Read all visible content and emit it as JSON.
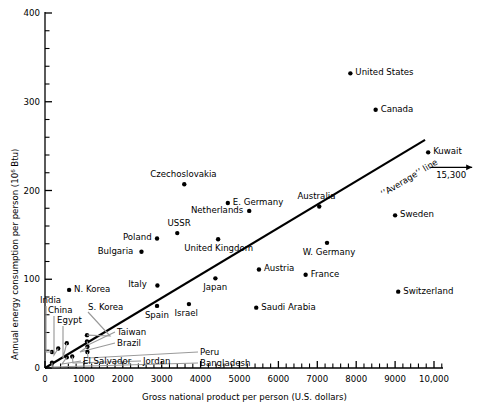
{
  "chart_data": {
    "type": "scatter",
    "title": "",
    "xlabel": "Gross national product per person (U.S. dollars)",
    "ylabel": "Annual energy consumption per person (10⁶ Btu)",
    "xlim": [
      0,
      10600
    ],
    "ylim": [
      0,
      400
    ],
    "xticks": [
      0,
      1000,
      2000,
      3000,
      4000,
      5000,
      6000,
      7000,
      8000,
      9000,
      10000
    ],
    "xtick_labels": [
      "0",
      "1000",
      "2000",
      "3000",
      "4000",
      "5000",
      "6000",
      "7000",
      "8000",
      "9000",
      "10,000"
    ],
    "yticks": [
      0,
      100,
      200,
      300,
      400
    ],
    "ytick_labels": [
      "0",
      "100",
      "200",
      "300",
      "400"
    ],
    "minor_ticks": true,
    "grid": false,
    "legend": null,
    "annotations": [
      {
        "name": "average-line",
        "text": "‘’Average’’ line"
      },
      {
        "name": "kuwait-offscale",
        "text": "15,300"
      }
    ],
    "trend_line": {
      "label": "‘’Average’’ line",
      "x_start": 0,
      "y_start": 0,
      "x_end": 9770,
      "y_end": 257
    },
    "points": [
      {
        "label": "United States",
        "x": 7850,
        "y": 332,
        "label_pos": "right"
      },
      {
        "label": "Canada",
        "x": 8500,
        "y": 291,
        "label_pos": "right"
      },
      {
        "label": "Kuwait",
        "x": 9850,
        "y": 243,
        "label_pos": "right",
        "offscale": "15,300"
      },
      {
        "label": "Czechoslovakia",
        "x": 3580,
        "y": 207,
        "label_pos": "above"
      },
      {
        "label": "E. Germany",
        "x": 4700,
        "y": 186,
        "label_pos": "right"
      },
      {
        "label": "Australia",
        "x": 7050,
        "y": 182,
        "label_pos": "above"
      },
      {
        "label": "Netherlands",
        "x": 5250,
        "y": 177,
        "label_pos": "left"
      },
      {
        "label": "Sweden",
        "x": 9000,
        "y": 172,
        "label_pos": "right"
      },
      {
        "label": "USSR",
        "x": 3400,
        "y": 152,
        "label_pos": "above"
      },
      {
        "label": "Poland",
        "x": 2880,
        "y": 146,
        "label_pos": "left"
      },
      {
        "label": "United Kingdom",
        "x": 4450,
        "y": 145,
        "label_pos": "below"
      },
      {
        "label": "W. Germany",
        "x": 7250,
        "y": 141,
        "label_pos": "below"
      },
      {
        "label": "Bulgaria",
        "x": 2480,
        "y": 131,
        "label_pos": "left"
      },
      {
        "label": "Austria",
        "x": 5500,
        "y": 111,
        "label_pos": "right"
      },
      {
        "label": "France",
        "x": 6700,
        "y": 105,
        "label_pos": "right"
      },
      {
        "label": "Japan",
        "x": 4380,
        "y": 101,
        "label_pos": "below"
      },
      {
        "label": "Italy",
        "x": 2890,
        "y": 93,
        "label_pos": "left"
      },
      {
        "label": "N. Korea",
        "x": 620,
        "y": 88,
        "label_pos": "right"
      },
      {
        "label": "Switzerland",
        "x": 9080,
        "y": 86,
        "label_pos": "right"
      },
      {
        "label": "Israel",
        "x": 3700,
        "y": 72,
        "label_pos": "below"
      },
      {
        "label": "Saudi Arabia",
        "x": 5430,
        "y": 68,
        "label_pos": "right"
      },
      {
        "label": "Spain",
        "x": 2880,
        "y": 70,
        "label_pos": "below"
      },
      {
        "label": "S. Korea",
        "x": 1080,
        "y": 37,
        "label_pos": "leader"
      },
      {
        "label": "Taiwan",
        "x": 1080,
        "y": 30,
        "label_pos": "leader"
      },
      {
        "label": "Brazil",
        "x": 1090,
        "y": 24,
        "label_pos": "leader"
      },
      {
        "label": "Peru",
        "x": 1090,
        "y": 18,
        "label_pos": "leader"
      },
      {
        "label": "Jordan",
        "x": 700,
        "y": 13,
        "label_pos": "leader"
      },
      {
        "label": "Bangladesh",
        "x": 180,
        "y": 6,
        "label_pos": "leader"
      },
      {
        "label": "El Salvador",
        "x": 560,
        "y": 12,
        "label_pos": "leader"
      },
      {
        "label": "India",
        "x": 180,
        "y": 18,
        "label_pos": "leader"
      },
      {
        "label": "China",
        "x": 340,
        "y": 22,
        "label_pos": "leader"
      },
      {
        "label": "Egypt",
        "x": 560,
        "y": 28,
        "label_pos": "leader"
      }
    ]
  },
  "axes": {
    "x_title": "Gross national product per person (U.S. dollars)",
    "y_title": "Annual energy consumption per person (10⁶ Btu)"
  }
}
